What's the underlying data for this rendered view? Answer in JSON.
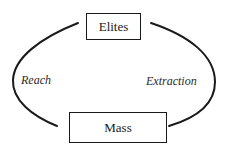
{
  "diagram": {
    "nodes": [
      {
        "id": "elites",
        "label": "Elites"
      },
      {
        "id": "mass",
        "label": "Mass"
      }
    ],
    "edges": [
      {
        "from": "elites",
        "to": "mass",
        "side": "left",
        "label": "Reach"
      },
      {
        "from": "mass",
        "to": "elites",
        "side": "right",
        "label": "Extraction"
      }
    ]
  },
  "colors": {
    "stroke": "#1a1a1a",
    "background": "#ffffff"
  }
}
